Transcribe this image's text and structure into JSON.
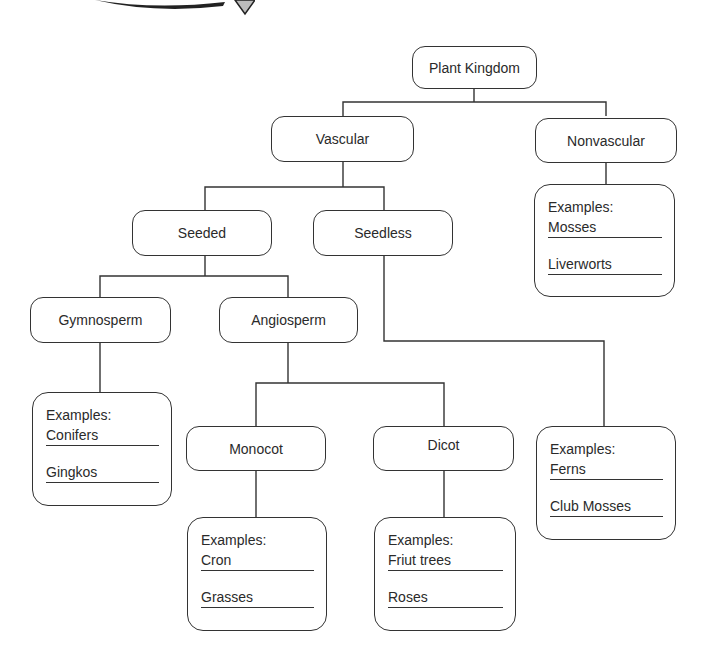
{
  "diagram": {
    "type": "hierarchy-tree",
    "title": "Plant Kingdom",
    "nodes": {
      "root": "Plant Kingdom",
      "vascular": "Vascular",
      "nonvascular": "Nonvascular",
      "seeded": "Seeded",
      "seedless": "Seedless",
      "gymnosperm": "Gymnosperm",
      "angiosperm": "Angiosperm",
      "monocot": "Monocot",
      "dicot": "Dicot"
    },
    "examples": {
      "nonvascular": {
        "header": "Examples:",
        "items": [
          "Mosses",
          "Liverworts"
        ]
      },
      "gymnosperm": {
        "header": "Examples:",
        "items": [
          "Conifers",
          "Gingkos"
        ]
      },
      "seedless": {
        "header": "Examples:",
        "items": [
          "Ferns",
          "Club Mosses"
        ]
      },
      "monocot": {
        "header": "Examples:",
        "items": [
          "Cron",
          "Grasses"
        ]
      },
      "dicot": {
        "header": "Examples:",
        "items": [
          "Friut trees",
          "Roses"
        ]
      }
    },
    "edges": [
      [
        "Plant Kingdom",
        "Vascular"
      ],
      [
        "Plant Kingdom",
        "Nonvascular"
      ],
      [
        "Vascular",
        "Seeded"
      ],
      [
        "Vascular",
        "Seedless"
      ],
      [
        "Seeded",
        "Gymnosperm"
      ],
      [
        "Seeded",
        "Angiosperm"
      ],
      [
        "Angiosperm",
        "Monocot"
      ],
      [
        "Angiosperm",
        "Dicot"
      ],
      [
        "Nonvascular",
        "Examples: Mosses, Liverworts"
      ],
      [
        "Gymnosperm",
        "Examples: Conifers, Gingkos"
      ],
      [
        "Seedless",
        "Examples: Ferns, Club Mosses"
      ],
      [
        "Monocot",
        "Examples: Cron, Grasses"
      ],
      [
        "Dicot",
        "Examples: Friut trees, Roses"
      ]
    ],
    "colors": {
      "stroke": "#333333",
      "text": "#2a2a2a",
      "background": "#ffffff"
    }
  }
}
